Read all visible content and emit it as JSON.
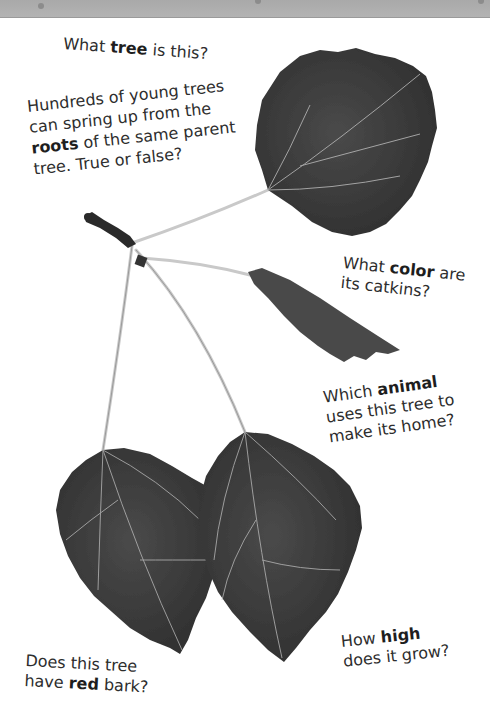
{
  "banner": {
    "color": "#ababab"
  },
  "questions": {
    "q1": {
      "pre": "What ",
      "bold": "tree",
      "post": " is this?"
    },
    "q2": {
      "line1": "Hundreds of young trees",
      "line2": "can spring up from the",
      "line3_bold": "roots",
      "line3_post": " of the same parent",
      "line4": "tree. True or false?"
    },
    "q3": {
      "pre": "What ",
      "bold": "color",
      "post": " are",
      "line2": "its catkins?"
    },
    "q4": {
      "pre": "Which ",
      "bold": "animal",
      "line2": "uses this tree to",
      "line3": "make its home?"
    },
    "q5": {
      "line1": "Does this tree",
      "pre": "have ",
      "bold": "red",
      "post": " bark?"
    },
    "q6": {
      "pre": "How ",
      "bold": "high",
      "line2": "does it grow?"
    }
  },
  "illustration": {
    "subject": "aspen-twig-with-four-leaves",
    "leaf_color": "#3a3a3a",
    "stem_color": "#c8c8c8"
  }
}
